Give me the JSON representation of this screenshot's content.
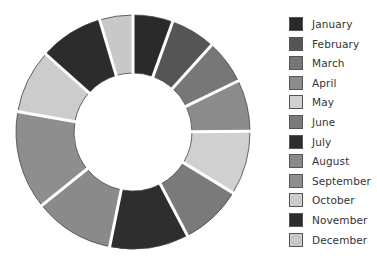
{
  "chart_data": {
    "type": "pie",
    "subtype": "donut",
    "title": "",
    "categories": [
      "January",
      "February",
      "March",
      "April",
      "May",
      "June",
      "July",
      "August",
      "September",
      "October",
      "November",
      "December"
    ],
    "values": [
      5.5,
      6.2,
      6.1,
      7.1,
      8.8,
      8.6,
      10.9,
      11.0,
      13.6,
      8.8,
      8.8,
      4.6
    ],
    "unit": "percent (estimated from slice angles; no data labels shown)",
    "colors": [
      "#2a2a2a",
      "#555555",
      "#777777",
      "#8c8c8c",
      "#d0d0d0",
      "#7a7a7a",
      "#2e2e2e",
      "#8a8a8a",
      "#8e8e8e",
      "#cccccc",
      "#2c2c2c",
      "#c8c8c8"
    ],
    "start_angle_deg": 0,
    "direction": "clockwise",
    "legend_position": "right",
    "grid": false
  },
  "legend": {
    "items": [
      {
        "label": "January"
      },
      {
        "label": "February"
      },
      {
        "label": "March"
      },
      {
        "label": "April"
      },
      {
        "label": "May"
      },
      {
        "label": "June"
      },
      {
        "label": "July"
      },
      {
        "label": "August"
      },
      {
        "label": "September"
      },
      {
        "label": "October"
      },
      {
        "label": "November"
      },
      {
        "label": "December"
      }
    ]
  }
}
